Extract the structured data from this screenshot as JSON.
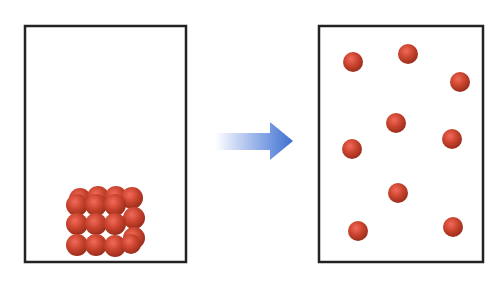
{
  "diagram": {
    "left_container": {
      "label": "",
      "state": "packed",
      "particle_color": "#c8432d"
    },
    "arrow": {
      "direction": "right",
      "color": "#3d6fd0"
    },
    "right_container": {
      "label": "",
      "state": "dispersed",
      "particle_count": 9,
      "particle_color": "#c8432d"
    },
    "right_particles": [
      {
        "x": 353,
        "y": 62
      },
      {
        "x": 408,
        "y": 54
      },
      {
        "x": 460,
        "y": 82
      },
      {
        "x": 396,
        "y": 123
      },
      {
        "x": 452,
        "y": 139
      },
      {
        "x": 352,
        "y": 149
      },
      {
        "x": 398,
        "y": 193
      },
      {
        "x": 358,
        "y": 231
      },
      {
        "x": 453,
        "y": 227
      }
    ]
  }
}
